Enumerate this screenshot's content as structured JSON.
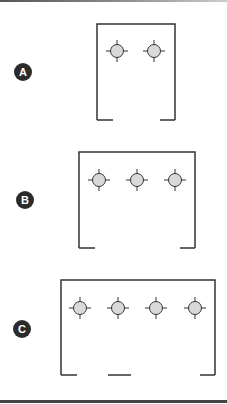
{
  "colors": {
    "line": "#333333",
    "fixture_fill": "#d9d9d9",
    "badge_fill": "#2b2b2b",
    "badge_text": "#ffffff",
    "rule": "#444444"
  },
  "panels": [
    {
      "label": "A",
      "badge": {
        "cx": 23,
        "cy": 72
      },
      "box": {
        "left": 97,
        "top": 24,
        "right": 175,
        "bottom": 120
      },
      "fixtures": [
        {
          "cx": 117,
          "cy": 51
        },
        {
          "cx": 154,
          "cy": 51
        }
      ],
      "bottom_segments": [
        [
          97,
          113
        ],
        [
          160,
          175
        ]
      ]
    },
    {
      "label": "B",
      "badge": {
        "cx": 25,
        "cy": 200
      },
      "box": {
        "left": 79,
        "top": 152,
        "right": 195,
        "bottom": 248
      },
      "fixtures": [
        {
          "cx": 99,
          "cy": 180
        },
        {
          "cx": 137,
          "cy": 180
        },
        {
          "cx": 175,
          "cy": 180
        }
      ],
      "bottom_segments": [
        [
          79,
          95
        ],
        [
          180,
          195
        ]
      ]
    },
    {
      "label": "C",
      "badge": {
        "cx": 22,
        "cy": 329
      },
      "box": {
        "left": 61,
        "top": 280,
        "right": 215,
        "bottom": 375
      },
      "fixtures": [
        {
          "cx": 80,
          "cy": 308
        },
        {
          "cx": 118,
          "cy": 308
        },
        {
          "cx": 156,
          "cy": 308
        },
        {
          "cx": 195,
          "cy": 308
        }
      ],
      "bottom_segments": [
        [
          61,
          77
        ],
        [
          108,
          131
        ],
        [
          200,
          215
        ]
      ]
    }
  ]
}
